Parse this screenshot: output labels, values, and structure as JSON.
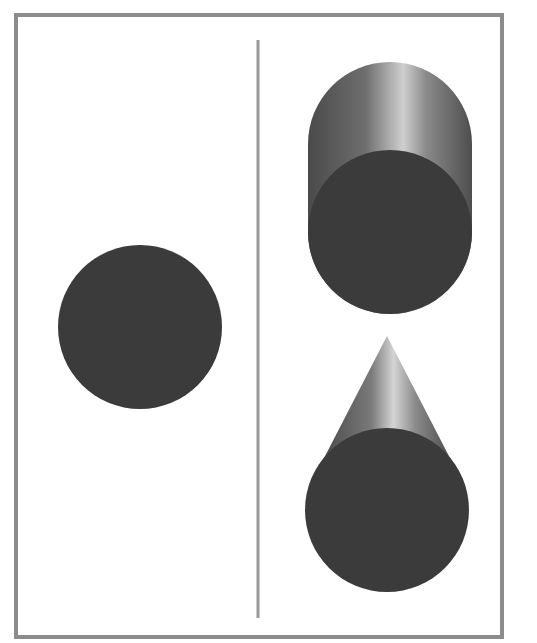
{
  "diagram": {
    "colors": {
      "frame": "#8c8c8c",
      "divider": "#9a9a9a",
      "shape_fill": "#3b3b3b",
      "highlight": "#c8c8c8",
      "shade_dark": "#555555"
    },
    "frame": {
      "x": 16,
      "y": 15,
      "width": 486,
      "height": 622
    },
    "divider": {
      "x": 258,
      "y1": 40,
      "y2": 618
    },
    "left_panel": {
      "circle": {
        "cx": 140,
        "cy": 327,
        "r": 82
      }
    },
    "right_panel": {
      "cylinder": {
        "cx": 390,
        "top_y": 62,
        "face_cy": 232,
        "r": 82
      },
      "cone": {
        "apex_x": 387,
        "apex_y": 336,
        "face_cx": 387,
        "face_cy": 510,
        "r": 82
      }
    }
  }
}
